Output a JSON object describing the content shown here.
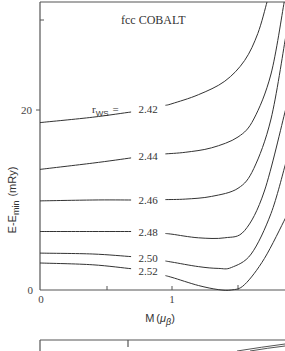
{
  "chart_data": {
    "type": "line",
    "title": "fcc COBALT",
    "xlabel": "M (μβ)",
    "ylabel": "E-Emin (mRy)",
    "xlim": [
      0,
      1.86
    ],
    "ylim": [
      0,
      32
    ],
    "x_ticks": [
      0,
      0.5,
      1,
      1.5
    ],
    "x_tick_labels": [
      "0",
      "",
      "1",
      ""
    ],
    "y_ticks": [
      0,
      20
    ],
    "y_tick_labels": [
      "0",
      "20"
    ],
    "grid": false,
    "legend": "inline labels on curves",
    "series_param_label": "rws",
    "series": [
      {
        "name": "2.42",
        "label": "rws = 2.42",
        "x": [
          0,
          0.4,
          0.8,
          1.0,
          1.2,
          1.4,
          1.55,
          1.65,
          1.72
        ],
        "y": [
          18.6,
          19.2,
          20.0,
          20.7,
          21.7,
          23.2,
          25.5,
          28.5,
          32
        ]
      },
      {
        "name": "2.44",
        "label": "2.44",
        "x": [
          0,
          0.4,
          0.85,
          1.1,
          1.3,
          1.5,
          1.62,
          1.75,
          1.85
        ],
        "y": [
          13.4,
          14.1,
          15.0,
          15.3,
          15.8,
          17.0,
          19.0,
          24.0,
          32
        ]
      },
      {
        "name": "2.46",
        "label": "2.46",
        "x": [
          0,
          0.4,
          0.8,
          1.1,
          1.3,
          1.5,
          1.62,
          1.75,
          1.86
        ],
        "y": [
          9.9,
          10.0,
          10.0,
          10.1,
          10.4,
          11.3,
          13.5,
          19.0,
          28
        ]
      },
      {
        "name": "2.48",
        "label": "2.48",
        "x": [
          0,
          0.4,
          0.8,
          1.0,
          1.2,
          1.4,
          1.55,
          1.7,
          1.86
        ],
        "y": [
          6.5,
          6.5,
          6.5,
          6.2,
          5.8,
          5.8,
          6.6,
          11.0,
          20
        ]
      },
      {
        "name": "2.50",
        "label": "2.50",
        "x": [
          0,
          0.4,
          0.8,
          1.0,
          1.2,
          1.35,
          1.45,
          1.6,
          1.75,
          1.86
        ],
        "y": [
          4.1,
          4.0,
          3.6,
          3.1,
          2.6,
          2.4,
          2.5,
          4.0,
          8.5,
          14
        ]
      },
      {
        "name": "2.52",
        "label": "2.52",
        "x": [
          0,
          0.4,
          0.8,
          1.0,
          1.2,
          1.35,
          1.45,
          1.55,
          1.7,
          1.86
        ],
        "y": [
          3.0,
          2.8,
          2.2,
          1.4,
          0.5,
          0.05,
          0.0,
          0.6,
          3.5,
          8.0
        ]
      }
    ],
    "annotations": [
      "tick mark at M≈1.45 on x-axis near minimum of 2.52 curve"
    ]
  },
  "panel": {
    "title": "fcc COBALT",
    "rws_prefix": "r",
    "rws_sub": "WS",
    "rws_eq": "=",
    "xlabel_main": "M",
    "xlabel_open": "(",
    "xlabel_mu": "μ",
    "xlabel_sub": "β",
    "xlabel_close": ")",
    "ylabel_main": "E-E",
    "ylabel_sub": "min",
    "ylabel_unit": "(mRy)",
    "y_tick_20": "20",
    "y_tick_0": "0",
    "x_tick_0": "0",
    "x_tick_1": "1"
  }
}
